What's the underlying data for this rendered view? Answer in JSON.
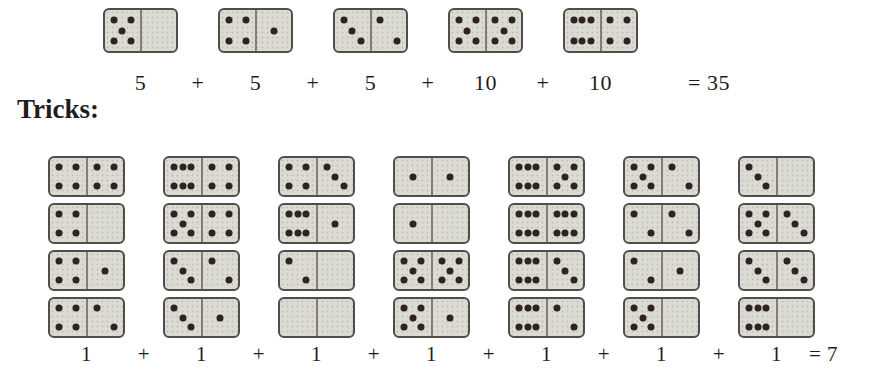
{
  "colors": {
    "background": "#ffffff",
    "domino_fill": "#dbdad3",
    "domino_border": "#4f4e4a",
    "domino_divider": "#807e76",
    "pip": "#2e2222",
    "text": "#1f1d1b"
  },
  "top_section": {
    "dominoes": [
      [
        5,
        0
      ],
      [
        4,
        1
      ],
      [
        3,
        2
      ],
      [
        5,
        5
      ],
      [
        6,
        4
      ]
    ],
    "equation": {
      "terms": [
        "5",
        "5",
        "5",
        "10",
        "10"
      ],
      "plus": "+",
      "result": "= 35"
    }
  },
  "tricks_label": "Tricks:",
  "tricks_section": {
    "columns": [
      {
        "dominoes": [
          [
            4,
            4
          ],
          [
            4,
            0
          ],
          [
            4,
            1
          ],
          [
            4,
            2
          ]
        ]
      },
      {
        "dominoes": [
          [
            6,
            4
          ],
          [
            5,
            4
          ],
          [
            3,
            2
          ],
          [
            3,
            1
          ]
        ]
      },
      {
        "dominoes": [
          [
            4,
            3
          ],
          [
            6,
            1
          ],
          [
            2,
            0
          ],
          [
            0,
            0
          ]
        ]
      },
      {
        "dominoes": [
          [
            1,
            1
          ],
          [
            1,
            0
          ],
          [
            5,
            5
          ],
          [
            5,
            1
          ]
        ]
      },
      {
        "dominoes": [
          [
            6,
            5
          ],
          [
            6,
            6
          ],
          [
            6,
            3
          ],
          [
            6,
            2
          ]
        ]
      },
      {
        "dominoes": [
          [
            5,
            2
          ],
          [
            2,
            2
          ],
          [
            2,
            1
          ],
          [
            5,
            0
          ]
        ]
      },
      {
        "dominoes": [
          [
            3,
            0
          ],
          [
            5,
            3
          ],
          [
            3,
            3
          ],
          [
            6,
            0
          ]
        ]
      }
    ],
    "equation": {
      "terms": [
        "1",
        "1",
        "1",
        "1",
        "1",
        "1",
        "1"
      ],
      "plus": "+",
      "result": "= 7"
    }
  }
}
